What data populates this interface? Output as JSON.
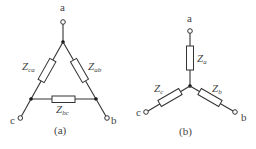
{
  "diagram": {
    "delta": {
      "caption": "(a)",
      "nodes": {
        "a": "a",
        "b": "b",
        "c": "c"
      },
      "impedances": [
        {
          "name": "Z",
          "sub": "ca"
        },
        {
          "name": "Z",
          "sub": "ab"
        },
        {
          "name": "Z",
          "sub": "bc"
        }
      ]
    },
    "wye": {
      "caption": "(b)",
      "nodes": {
        "a": "a",
        "b": "b",
        "c": "c"
      },
      "impedances": [
        {
          "name": "Z",
          "sub": "a"
        },
        {
          "name": "Z",
          "sub": "b"
        },
        {
          "name": "Z",
          "sub": "c"
        }
      ]
    }
  }
}
